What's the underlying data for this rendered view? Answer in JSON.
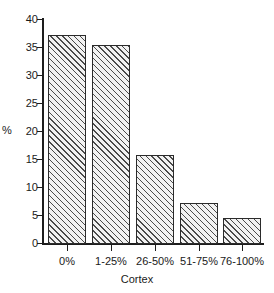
{
  "chart_data": {
    "type": "bar",
    "title": "",
    "subtitle": "",
    "categories": [
      "0%",
      "1-25%",
      "26-50%",
      "51-75%",
      "76-100%"
    ],
    "values": [
      37.0,
      35.2,
      15.7,
      7.3,
      4.6
    ],
    "xlabel": "Cortex",
    "ylabel": "%",
    "ylim": [
      0,
      40
    ],
    "yticks": [
      0,
      5,
      10,
      15,
      20,
      25,
      30,
      35,
      40
    ],
    "ytick_labels": [
      "0",
      "5",
      "10",
      "15",
      "20",
      "25",
      "30",
      "35",
      "40"
    ],
    "grid": false,
    "legend": null,
    "annotations": [],
    "bar_style": {
      "fill": "#f2f2f2",
      "hatch": "diagonal-lines",
      "hatch_color": "#4a4a4a",
      "edge_color": "#2b2b2b"
    },
    "axis_color": "#1d1d1d",
    "background": "#ffffff"
  }
}
